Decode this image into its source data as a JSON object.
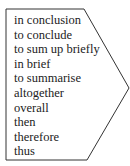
{
  "diagram": {
    "shape": "arrow-pentagon-right",
    "stroke_color": "#333333",
    "fill_color": "#ffffff",
    "items": [
      "in conclusion",
      "to conclude",
      "to sum up briefly",
      "in brief",
      "to summarise",
      "altogether",
      "overall",
      "then",
      "therefore",
      "thus"
    ]
  }
}
